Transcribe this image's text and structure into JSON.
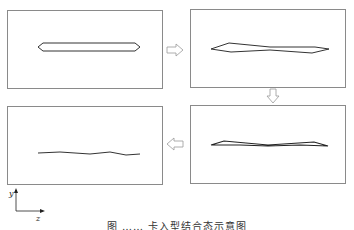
{
  "diagram": {
    "type": "process-flow",
    "panels": [
      {
        "id": "panel-1",
        "step": 1,
        "description": "initial elongated hexagonal cross-section"
      },
      {
        "id": "panel-2",
        "step": 2,
        "description": "twisted/crossed elongated shape"
      },
      {
        "id": "panel-3",
        "step": 3,
        "description": "flattened shape nearly collapsed"
      },
      {
        "id": "panel-4",
        "step": 4,
        "description": "collapsed wavy line"
      }
    ],
    "flow": [
      {
        "from": "panel-1",
        "to": "panel-2",
        "direction": "right"
      },
      {
        "from": "panel-2",
        "to": "panel-3",
        "direction": "down"
      },
      {
        "from": "panel-3",
        "to": "panel-4",
        "direction": "left"
      }
    ],
    "axes": {
      "vertical_label": "y",
      "horizontal_label": "z"
    },
    "caption": "图 ……  卡入型结合态示意图",
    "colors": {
      "stroke": "#333333",
      "frame": "#888888",
      "arrow": "#999999"
    }
  }
}
